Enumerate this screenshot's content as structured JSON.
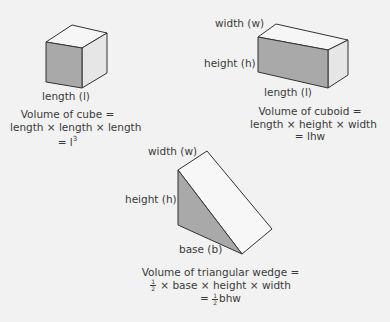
{
  "cube": {
    "label_length": "length (l)",
    "formula_line1": "Volume of cube =",
    "formula_line2": "length × length × length",
    "formula_line3_prefix": "= l",
    "formula_line3_exp": "3"
  },
  "cuboid": {
    "label_width": "width (w)",
    "label_height": "height (h)",
    "label_length": "length (l)",
    "formula_line1": "Volume of cuboid =",
    "formula_line2": "length × height × width",
    "formula_line3": "= lhw"
  },
  "wedge": {
    "label_width": "width (w)",
    "label_height": "height (h)",
    "label_base": "base (b)",
    "formula_line1": "Volume of triangular wedge =",
    "frac_num": "1",
    "frac_den": "2",
    "formula_line2_rest": "× base × height × width",
    "formula_line3_prefix": "=",
    "formula_line3_rest": "bhw"
  },
  "colors": {
    "background": "#f2f2f2",
    "shaded_face": "#a9a9a9",
    "light_face": "#e8e8e8",
    "top_face": "#f6f6f6",
    "edge": "#333333"
  }
}
